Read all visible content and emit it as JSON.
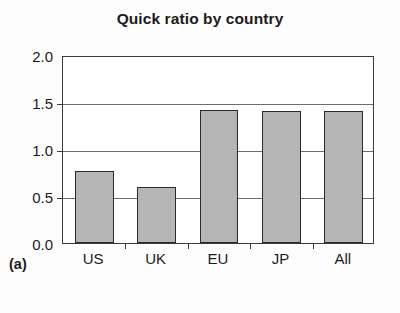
{
  "figure": {
    "panel_label": "(a)"
  },
  "chart_data": {
    "type": "bar",
    "title": "Quick ratio by country",
    "subtitle": "",
    "xlabel": "",
    "ylabel": "",
    "categories": [
      "US",
      "UK",
      "EU",
      "JP",
      "All"
    ],
    "values": [
      0.77,
      0.6,
      1.42,
      1.4,
      1.4
    ],
    "series": [
      {
        "name": "Quick ratio",
        "values": [
          0.77,
          0.6,
          1.42,
          1.4,
          1.4
        ]
      }
    ],
    "ylim": [
      0.0,
      2.0
    ],
    "ytick_values": [
      0.0,
      0.5,
      1.0,
      1.5,
      2.0
    ],
    "ytick_labels": [
      "0.0",
      "0.5",
      "1.0",
      "1.5",
      "2.0"
    ],
    "gridlines": [
      0.5,
      1.0,
      1.5
    ],
    "grid": true,
    "legend": false,
    "legend_position": "none",
    "bar_fill_color": "#b5b5b5",
    "bar_edge_color": "#2a2a2a",
    "axis_color": "#3a3a3a",
    "grid_color": "#6d6d6d",
    "background_color": "#ffffff",
    "text_color": "#1b1b1b"
  }
}
